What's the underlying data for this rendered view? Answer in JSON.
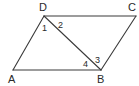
{
  "figure": {
    "type": "parallelogram-with-diagonal",
    "vertices": {
      "A": {
        "label": "A",
        "x": 13,
        "y": 70,
        "label_x": 8,
        "label_y": 83
      },
      "B": {
        "label": "B",
        "x": 101,
        "y": 70,
        "label_x": 97,
        "label_y": 83
      },
      "C": {
        "label": "C",
        "x": 136,
        "y": 16,
        "label_x": 128,
        "label_y": 11
      },
      "D": {
        "label": "D",
        "x": 44,
        "y": 16,
        "label_x": 39,
        "label_y": 11
      }
    },
    "edges": [
      {
        "from": "A",
        "to": "B"
      },
      {
        "from": "B",
        "to": "C"
      },
      {
        "from": "C",
        "to": "D"
      },
      {
        "from": "D",
        "to": "A"
      },
      {
        "from": "D",
        "to": "B"
      }
    ],
    "angles": [
      {
        "label": "1",
        "x": 42,
        "y": 31
      },
      {
        "label": "2",
        "x": 58,
        "y": 28
      },
      {
        "label": "3",
        "x": 95,
        "y": 63
      },
      {
        "label": "4",
        "x": 83,
        "y": 67
      }
    ],
    "colors": {
      "stroke": "#3a3a3a",
      "text": "#2a2a2a",
      "background": "#ffffff"
    }
  }
}
